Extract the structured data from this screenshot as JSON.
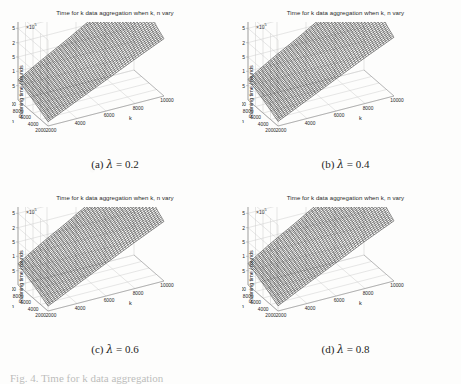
{
  "figure": {
    "layout": "2x2 grid of 3D surface plots",
    "partial_bottom_caption": "Fig. 4. Time for k data aggregation"
  },
  "common": {
    "plot_title": "Time for k data aggregation when k, n vary",
    "y_axis_label": "Running time / rounds",
    "y_exponent_label": "×10",
    "y_exponent_power": "5",
    "x_axis_label": "k",
    "depth_axis_label": "n",
    "y_ticks": [
      "0.5",
      "1",
      "1.5",
      "2",
      "2.5",
      "3"
    ],
    "k_ticks": [
      "2000",
      "4000",
      "6000",
      "8000",
      "10000"
    ],
    "n_ticks": [
      "10000",
      "8000",
      "6000",
      "4000",
      "2000"
    ],
    "colors": {
      "surface": "#101010",
      "gridline": "#c9c9c9",
      "axis_line": "#8d8d8d",
      "text": "#262626",
      "background": "#fdfdfc"
    }
  },
  "panels": [
    {
      "id": "a",
      "caption_index": "(a)",
      "caption_symbol": "λ",
      "caption_value": "= 0.2",
      "lambda": 0.2
    },
    {
      "id": "b",
      "caption_index": "(b)",
      "caption_symbol": "λ",
      "caption_value": "= 0.4",
      "lambda": 0.4
    },
    {
      "id": "c",
      "caption_index": "(c)",
      "caption_symbol": "λ",
      "caption_value": "= 0.6",
      "lambda": 0.6
    },
    {
      "id": "d",
      "caption_index": "(d)",
      "caption_symbol": "λ",
      "caption_value": "= 0.8",
      "lambda": 0.8
    }
  ],
  "chart_data": [
    {
      "type": "surface",
      "title": "Time for k data aggregation when k, n vary",
      "subtitle": "(a) λ = 0.2",
      "xlabel": "k",
      "ylabel": "n",
      "zlabel": "Running time / rounds",
      "z_scale": "1e5",
      "xlim": [
        2000,
        10000
      ],
      "ylim": [
        2000,
        10000
      ],
      "zlim": [
        0,
        3
      ],
      "x": [
        2000,
        4000,
        6000,
        8000,
        10000
      ],
      "y": [
        2000,
        4000,
        6000,
        8000,
        10000
      ],
      "z": [
        [
          0.15,
          0.62,
          1.08,
          1.55,
          2.0
        ],
        [
          0.3,
          0.8,
          1.3,
          1.78,
          2.25
        ],
        [
          0.45,
          0.98,
          1.52,
          2.02,
          2.5
        ],
        [
          0.58,
          1.14,
          1.7,
          2.22,
          2.72
        ],
        [
          0.7,
          1.28,
          1.86,
          2.4,
          2.92
        ]
      ],
      "grid": true,
      "legend": "none"
    },
    {
      "type": "surface",
      "title": "Time for k data aggregation when k, n vary",
      "subtitle": "(b) λ = 0.4",
      "xlabel": "k",
      "ylabel": "n",
      "zlabel": "Running time / rounds",
      "z_scale": "1e5",
      "xlim": [
        2000,
        10000
      ],
      "ylim": [
        2000,
        10000
      ],
      "zlim": [
        0,
        3
      ],
      "x": [
        2000,
        4000,
        6000,
        8000,
        10000
      ],
      "y": [
        2000,
        4000,
        6000,
        8000,
        10000
      ],
      "z": [
        [
          0.16,
          0.64,
          1.12,
          1.6,
          2.05
        ],
        [
          0.32,
          0.84,
          1.34,
          1.83,
          2.3
        ],
        [
          0.47,
          1.01,
          1.56,
          2.07,
          2.56
        ],
        [
          0.6,
          1.17,
          1.74,
          2.27,
          2.78
        ],
        [
          0.72,
          1.32,
          1.9,
          2.46,
          2.98
        ]
      ],
      "grid": true,
      "legend": "none"
    },
    {
      "type": "surface",
      "title": "Time for k data aggregation when k, n vary",
      "subtitle": "(c) λ = 0.6",
      "xlabel": "k",
      "ylabel": "n",
      "zlabel": "Running time / rounds",
      "z_scale": "1e5",
      "xlim": [
        2000,
        10000
      ],
      "ylim": [
        2000,
        10000
      ],
      "zlim": [
        0,
        3
      ],
      "x": [
        2000,
        4000,
        6000,
        8000,
        10000
      ],
      "y": [
        2000,
        4000,
        6000,
        8000,
        10000
      ],
      "z": [
        [
          0.17,
          0.66,
          1.14,
          1.62,
          2.08
        ],
        [
          0.33,
          0.86,
          1.37,
          1.86,
          2.34
        ],
        [
          0.48,
          1.03,
          1.58,
          2.1,
          2.6
        ],
        [
          0.61,
          1.19,
          1.77,
          2.3,
          2.82
        ],
        [
          0.74,
          1.35,
          1.94,
          2.5,
          3.0
        ]
      ],
      "grid": true,
      "legend": "none"
    },
    {
      "type": "surface",
      "title": "Time for k data aggregation when k, n vary",
      "subtitle": "(d) λ = 0.8",
      "xlabel": "k",
      "ylabel": "n",
      "zlabel": "Running time / rounds",
      "z_scale": "1e5",
      "xlim": [
        2000,
        10000
      ],
      "ylim": [
        2000,
        10000
      ],
      "zlim": [
        0,
        3
      ],
      "x": [
        2000,
        4000,
        6000,
        8000,
        10000
      ],
      "y": [
        2000,
        4000,
        6000,
        8000,
        10000
      ],
      "z": [
        [
          0.18,
          0.68,
          1.16,
          1.65,
          2.1
        ],
        [
          0.34,
          0.88,
          1.39,
          1.89,
          2.37
        ],
        [
          0.49,
          1.05,
          1.61,
          2.13,
          2.63
        ],
        [
          0.63,
          1.21,
          1.79,
          2.33,
          2.86
        ],
        [
          0.75,
          1.37,
          1.97,
          2.54,
          3.05
        ]
      ],
      "grid": true,
      "legend": "none"
    }
  ]
}
